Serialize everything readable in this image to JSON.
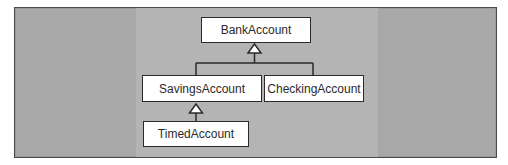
{
  "diagram": {
    "type": "uml-class-inheritance",
    "classes": [
      {
        "id": "bank",
        "label": "BankAccount"
      },
      {
        "id": "savings",
        "label": "SavingsAccount"
      },
      {
        "id": "checking",
        "label": "CheckingAccount"
      },
      {
        "id": "timed",
        "label": "TimedAccount"
      }
    ],
    "relationships": [
      {
        "type": "generalization",
        "from": "SavingsAccount",
        "to": "BankAccount"
      },
      {
        "type": "generalization",
        "from": "CheckingAccount",
        "to": "BankAccount"
      },
      {
        "type": "generalization",
        "from": "TimedAccount",
        "to": "SavingsAccount"
      }
    ],
    "colors": {
      "background": "#a8a8a8",
      "center_panel": "#b4b4b4",
      "box_fill": "#ffffff",
      "line": "#2a2a2a",
      "text": "#2b2b2b"
    }
  }
}
